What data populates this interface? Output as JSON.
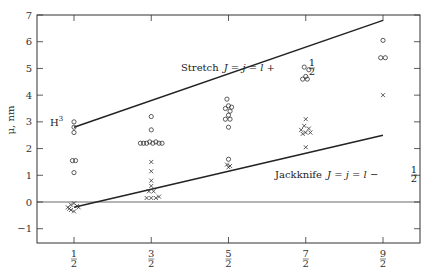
{
  "chart_data": {
    "type": "scatter",
    "title": "",
    "xlabel": "",
    "ylabel": "μ, nm",
    "xlim": [
      0.0,
      5.0
    ],
    "ylim": [
      -1.5,
      7
    ],
    "x_ticks": [
      0.5,
      1.5,
      2.5,
      3.5,
      4.5
    ],
    "x_tick_labels": [
      {
        "num": "1",
        "den": "2"
      },
      {
        "num": "3",
        "den": "2"
      },
      {
        "num": "5",
        "den": "2"
      },
      {
        "num": "7",
        "den": "2"
      },
      {
        "num": "9",
        "den": "2"
      }
    ],
    "y_ticks": [
      -1,
      0,
      1,
      2,
      3,
      4,
      5,
      6,
      7
    ],
    "y_tick_labels": [
      "−1",
      "0",
      "1",
      "2",
      "3",
      "4",
      "5",
      "6",
      "7"
    ],
    "grid": false,
    "zero_line": true,
    "series": [
      {
        "name": "J = l + 1/2 (circles)",
        "marker": "circle",
        "points": [
          [
            0.5,
            3.0
          ],
          [
            0.5,
            2.8
          ],
          [
            0.5,
            2.6
          ],
          [
            0.48,
            1.55
          ],
          [
            0.52,
            1.55
          ],
          [
            0.5,
            1.1
          ],
          [
            1.5,
            3.2
          ],
          [
            1.5,
            2.7
          ],
          [
            1.36,
            2.2
          ],
          [
            1.4,
            2.2
          ],
          [
            1.44,
            2.2
          ],
          [
            1.48,
            2.25
          ],
          [
            1.52,
            2.2
          ],
          [
            1.56,
            2.25
          ],
          [
            1.6,
            2.2
          ],
          [
            1.64,
            2.2
          ],
          [
            2.48,
            3.85
          ],
          [
            2.5,
            3.6
          ],
          [
            2.54,
            3.55
          ],
          [
            2.46,
            3.5
          ],
          [
            2.52,
            3.4
          ],
          [
            2.5,
            3.25
          ],
          [
            2.46,
            3.1
          ],
          [
            2.52,
            3.1
          ],
          [
            2.5,
            2.8
          ],
          [
            2.5,
            1.6
          ],
          [
            3.48,
            5.05
          ],
          [
            3.54,
            4.95
          ],
          [
            3.5,
            4.7
          ],
          [
            3.46,
            4.6
          ],
          [
            3.52,
            4.6
          ],
          [
            4.5,
            6.05
          ],
          [
            4.47,
            5.4
          ],
          [
            4.53,
            5.4
          ]
        ]
      },
      {
        "name": "J = l − 1/2 (crosses)",
        "marker": "cross",
        "points": [
          [
            0.42,
            -0.2
          ],
          [
            0.46,
            -0.1
          ],
          [
            0.5,
            -0.05
          ],
          [
            0.54,
            -0.15
          ],
          [
            0.46,
            -0.3
          ],
          [
            0.5,
            -0.35
          ],
          [
            0.56,
            -0.2
          ],
          [
            0.44,
            -0.25
          ],
          [
            1.5,
            1.5
          ],
          [
            1.5,
            1.15
          ],
          [
            1.5,
            0.8
          ],
          [
            1.5,
            0.6
          ],
          [
            1.47,
            0.4
          ],
          [
            1.53,
            0.4
          ],
          [
            1.44,
            0.15
          ],
          [
            1.5,
            0.15
          ],
          [
            1.56,
            0.15
          ],
          [
            1.6,
            0.2
          ],
          [
            2.48,
            1.4
          ],
          [
            2.52,
            1.35
          ],
          [
            2.5,
            1.3
          ],
          [
            3.5,
            3.1
          ],
          [
            3.48,
            2.85
          ],
          [
            3.54,
            2.75
          ],
          [
            3.44,
            2.7
          ],
          [
            3.5,
            2.6
          ],
          [
            3.56,
            2.6
          ],
          [
            3.46,
            2.55
          ],
          [
            3.5,
            2.05
          ],
          [
            4.5,
            4.0
          ]
        ]
      }
    ],
    "lines": [
      {
        "name": "Stretch",
        "x": [
          0.5,
          4.5
        ],
        "y": [
          2.8,
          6.8
        ]
      },
      {
        "name": "Jackknife",
        "x": [
          0.5,
          4.5
        ],
        "y": [
          -0.2,
          2.5
        ]
      }
    ],
    "annotations": [
      {
        "text": "Stretch  J = j = l + ½",
        "x": 1.75,
        "y": 5.0
      },
      {
        "text": "Jackknife  J = j = l − ½",
        "x": 3.5,
        "y": 1.1
      },
      {
        "text": "H³",
        "x": 0.2,
        "y": 3.0
      }
    ]
  },
  "labels": {
    "ylabel": "μ, nm",
    "h3_base": "H",
    "h3_sup": "3",
    "stretch_word": "Stretch",
    "stretch_eq": "J = j = l +",
    "jack_word": "Jackknife",
    "jack_eq": "J = j = l −",
    "half_num": "1",
    "half_den": "2"
  }
}
